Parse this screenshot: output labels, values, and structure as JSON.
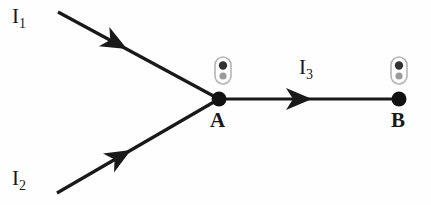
{
  "figure": {
    "type": "circuit-junction-diagram",
    "background_color": "#fefefe",
    "ink_color": "#191919",
    "width": 431,
    "height": 205
  },
  "labels": {
    "current_1": {
      "symbol": "I",
      "subscript": "1",
      "text": "I1"
    },
    "current_2": {
      "symbol": "I",
      "subscript": "2",
      "text": "I2"
    },
    "current_3": {
      "symbol": "I",
      "subscript": "3",
      "text": "I3"
    },
    "node_a": "A",
    "node_b": "B"
  },
  "nodes": [
    {
      "name": "A",
      "x": 219,
      "y": 99,
      "radius": 7.5,
      "filled": true,
      "color": "#111111"
    },
    {
      "name": "B",
      "x": 399,
      "y": 99,
      "radius": 7.5,
      "filled": true,
      "color": "#111111"
    }
  ],
  "wires": [
    {
      "name": "wire-I1",
      "label": "I1",
      "from": {
        "x": 58,
        "y": 12
      },
      "to": {
        "x": 219,
        "y": 99
      },
      "arrow_at": 0.42,
      "direction": "into-node-A"
    },
    {
      "name": "wire-I2",
      "label": "I2",
      "from": {
        "x": 57,
        "y": 193
      },
      "to": {
        "x": 219,
        "y": 99
      },
      "arrow_at": 0.45,
      "direction": "into-node-A"
    },
    {
      "name": "wire-I3",
      "label": "I3",
      "from": {
        "x": 219,
        "y": 99
      },
      "to": {
        "x": 399,
        "y": 99
      },
      "arrow_at": 0.46,
      "direction": "A-to-B"
    }
  ],
  "markers": [
    {
      "name": "two-dot-marker-left",
      "x": 223,
      "y": 70,
      "width": 16,
      "height": 27
    },
    {
      "name": "two-dot-marker-right",
      "x": 399,
      "y": 70,
      "width": 16,
      "height": 27
    }
  ],
  "marker_colors": {
    "outline": "#b4b4b4",
    "dot_top": "#333333",
    "dot_bottom": "#9a9a9a"
  }
}
